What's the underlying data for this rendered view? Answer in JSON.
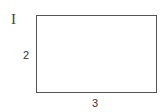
{
  "figure": {
    "label": "I",
    "shape": "rectangle",
    "side_labels": {
      "height": "2",
      "width": "3"
    },
    "dimensions": {
      "height": 2,
      "width": 3
    },
    "colors": {
      "stroke": "#555555",
      "text": "#333333",
      "background": "#ffffff"
    }
  }
}
